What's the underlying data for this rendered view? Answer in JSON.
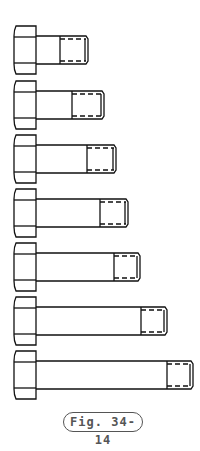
{
  "figure": {
    "caption": "Fig. 34-14",
    "bolts": [
      {
        "top": 26,
        "end": 88,
        "thread": 60
      },
      {
        "top": 81,
        "end": 104,
        "thread": 72
      },
      {
        "top": 135,
        "end": 116,
        "thread": 87
      },
      {
        "top": 189,
        "end": 128,
        "thread": 100
      },
      {
        "top": 243,
        "end": 140,
        "thread": 114
      },
      {
        "top": 297,
        "end": 167,
        "thread": 141
      },
      {
        "top": 351,
        "end": 193,
        "thread": 167
      }
    ]
  }
}
